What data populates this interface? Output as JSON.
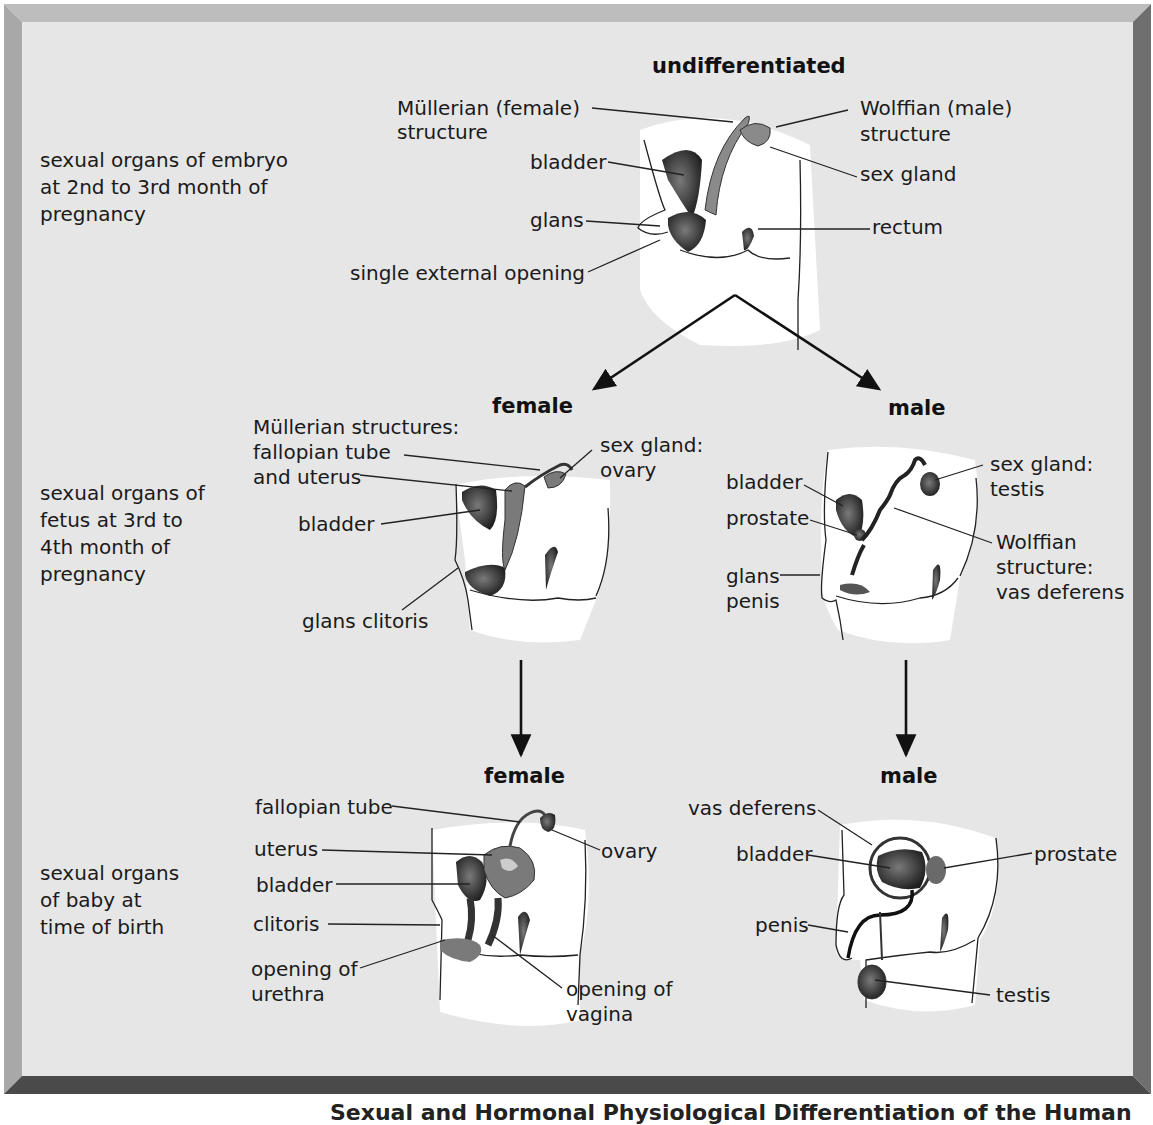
{
  "stages": {
    "embryo": {
      "description": "sexual organs of embryo at 2nd to 3rd month of pregnancy",
      "lines": [
        "sexual organs of embryo",
        "at 2nd to 3rd month of",
        "pregnancy"
      ],
      "heading": "undifferentiated",
      "labels": {
        "mullerian_1": "Müllerian (female)",
        "mullerian_2": "structure",
        "wolffian_1": "Wolffian (male)",
        "wolffian_2": "structure",
        "bladder": "bladder",
        "sex_gland": "sex gland",
        "glans": "glans",
        "rectum": "rectum",
        "single_opening": "single external opening"
      }
    },
    "fetus": {
      "lines": [
        "sexual organs of",
        "fetus at 3rd to",
        "4th month of",
        "pregnancy"
      ],
      "female": {
        "heading": "female",
        "labels": {
          "mullerian_1": "Müllerian structures:",
          "mullerian_2": "fallopian tube",
          "mullerian_3": "and uterus",
          "sex_gland_1": "sex gland:",
          "sex_gland_2": "ovary",
          "bladder": "bladder",
          "glans_clitoris": "glans clitoris"
        }
      },
      "male": {
        "heading": "male",
        "labels": {
          "bladder": "bladder",
          "prostate": "prostate",
          "glans_1": "glans",
          "glans_2": "penis",
          "sex_gland_1": "sex gland:",
          "sex_gland_2": "testis",
          "wolffian_1": "Wolffian",
          "wolffian_2": "structure:",
          "wolffian_3": "vas deferens"
        }
      }
    },
    "baby": {
      "lines": [
        "sexual organs",
        "of baby at",
        "time of birth"
      ],
      "female": {
        "heading": "female",
        "labels": {
          "fallopian_tube": "fallopian tube",
          "uterus": "uterus",
          "bladder": "bladder",
          "clitoris": "clitoris",
          "urethra_1": "opening of",
          "urethra_2": "urethra",
          "ovary": "ovary",
          "vagina_1": "opening of",
          "vagina_2": "vagina"
        }
      },
      "male": {
        "heading": "male",
        "labels": {
          "vas_deferens": "vas deferens",
          "bladder": "bladder",
          "prostate": "prostate",
          "penis": "penis",
          "testis": "testis"
        }
      }
    }
  },
  "caption": "Sexual and Hormonal Physiological Differentiation of the Human",
  "colors": {
    "panel_bg": "#e6e6e6",
    "organ_dark": "#2b2b2b",
    "organ_mid": "#6e6e6e",
    "body_fill": "#ffffff",
    "frame_light": "#bdbdbd",
    "frame_dark": "#4a4a4a"
  }
}
